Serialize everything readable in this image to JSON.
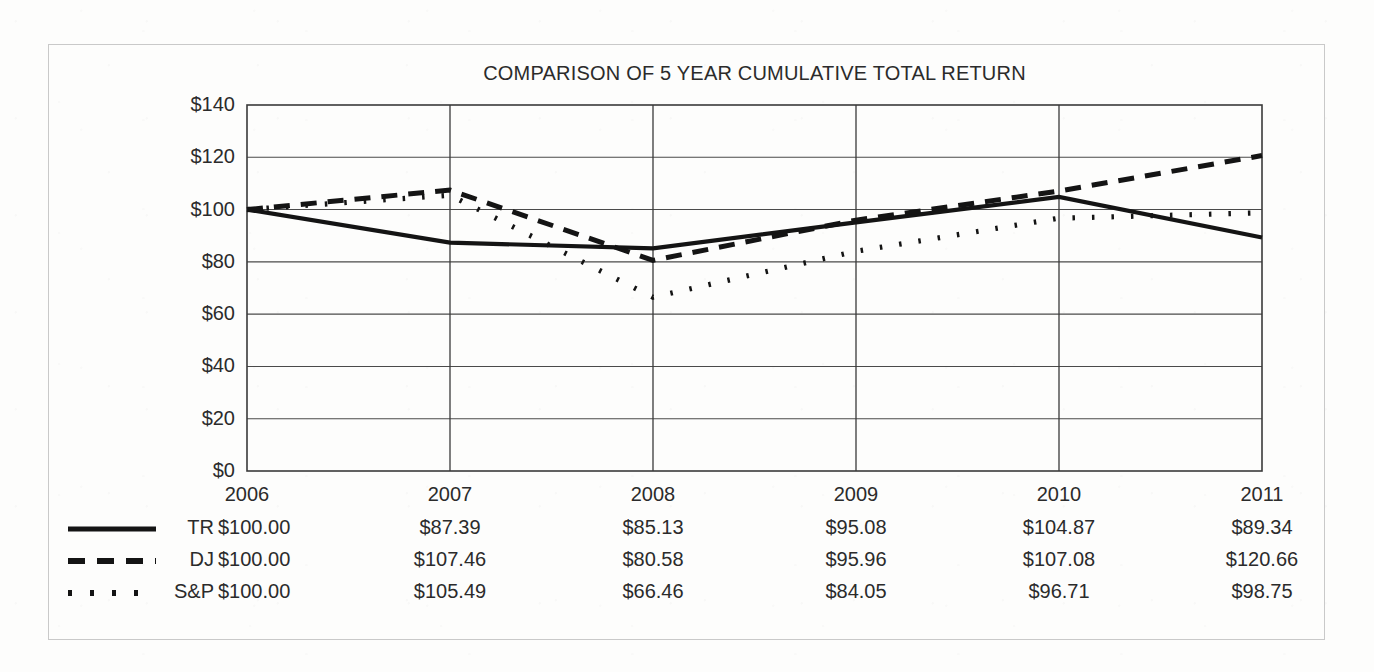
{
  "document": {
    "frame_color": "#c9c9c9",
    "background": "#fdfdfc",
    "ink_color": "#1a1a1a"
  },
  "chart_data": {
    "type": "line",
    "title": "COMPARISON OF 5 YEAR CUMULATIVE TOTAL RETURN",
    "xlabel": "",
    "ylabel": "",
    "categories": [
      "2006",
      "2007",
      "2008",
      "2009",
      "2010",
      "2011"
    ],
    "ylim": [
      0,
      140
    ],
    "ytick_step": 20,
    "ytick_labels": [
      "$0",
      "$20",
      "$40",
      "$60",
      "$80",
      "$100",
      "$120",
      "$140"
    ],
    "ytick_values": [
      0,
      20,
      40,
      60,
      80,
      100,
      120,
      140
    ],
    "grid": "horizontal-and-vertical",
    "legend_position": "below-table-left",
    "series": [
      {
        "name": "TR",
        "style": "solid",
        "values": [
          100.0,
          87.39,
          85.13,
          95.08,
          104.87,
          89.34
        ],
        "labels": [
          "$100.00",
          "$87.39",
          "$85.13",
          "$95.08",
          "$104.87",
          "$89.34"
        ]
      },
      {
        "name": "DJ",
        "style": "dashed",
        "values": [
          100.0,
          107.46,
          80.58,
          95.96,
          107.08,
          120.66
        ],
        "labels": [
          "$100.00",
          "$107.46",
          "$80.58",
          "$95.96",
          "$107.08",
          "$120.66"
        ]
      },
      {
        "name": "S&P",
        "style": "dotted",
        "values": [
          100.0,
          105.49,
          66.46,
          84.05,
          96.71,
          98.75
        ],
        "labels": [
          "$100.00",
          "$105.49",
          "$66.46",
          "$84.05",
          "$96.71",
          "$98.75"
        ]
      }
    ]
  }
}
